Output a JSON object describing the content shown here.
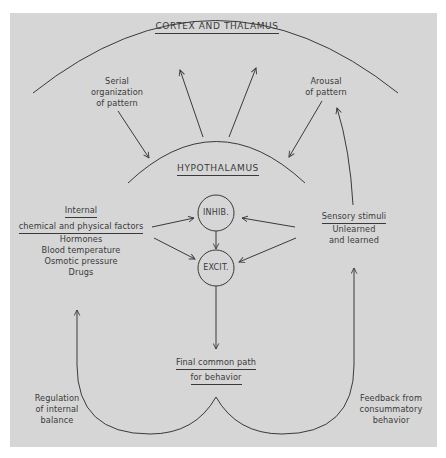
{
  "diagram": {
    "colors": {
      "background": "#ffffff",
      "panel": "#d6d6d6",
      "stroke": "#3a3a3a",
      "text": "#3a3a3a"
    },
    "regions": {
      "cortex": "CORTEX AND THALAMUS",
      "hypothalamus": "HYPOTHALAMUS"
    },
    "nodes": {
      "inhib": "INHIB.",
      "excit": "EXCIT."
    },
    "labels": {
      "serial": [
        "Serial",
        "organization",
        "of pattern"
      ],
      "arousal": [
        "Arousal",
        "of pattern"
      ],
      "internal": {
        "title_line1": "Internal",
        "title_line2": "chemical and physical factors",
        "items": [
          "Hormones",
          "Blood temperature",
          "Osmotic pressure",
          "Drugs"
        ]
      },
      "sensory": {
        "title": "Sensory stimuli",
        "items": [
          "Unlearned",
          "and learned"
        ]
      },
      "final_path": [
        "Final common path",
        "for behavior"
      ],
      "regulation": [
        "Regulation",
        "of internal",
        "balance"
      ],
      "feedback": [
        "Feedback from",
        "consummatory",
        "behavior"
      ]
    },
    "edges": [
      {
        "from": "hypothalamus",
        "to": "cortex"
      },
      {
        "from": "hypothalamus",
        "to": "cortex"
      },
      {
        "from": "serial_organization_of_pattern",
        "to": "hypothalamus"
      },
      {
        "from": "arousal_of_pattern",
        "to": "hypothalamus"
      },
      {
        "from": "sensory_stimuli",
        "to": "arousal_of_pattern"
      },
      {
        "from": "internal_factors",
        "to": "inhib"
      },
      {
        "from": "internal_factors",
        "to": "excit"
      },
      {
        "from": "sensory_stimuli",
        "to": "inhib"
      },
      {
        "from": "sensory_stimuli",
        "to": "excit"
      },
      {
        "from": "inhib",
        "to": "excit"
      },
      {
        "from": "excit",
        "to": "final_common_path"
      },
      {
        "from": "final_common_path",
        "to": "internal_factors",
        "label": "Regulation of internal balance"
      },
      {
        "from": "final_common_path",
        "to": "sensory_stimuli",
        "label": "Feedback from consummatory behavior"
      }
    ]
  }
}
